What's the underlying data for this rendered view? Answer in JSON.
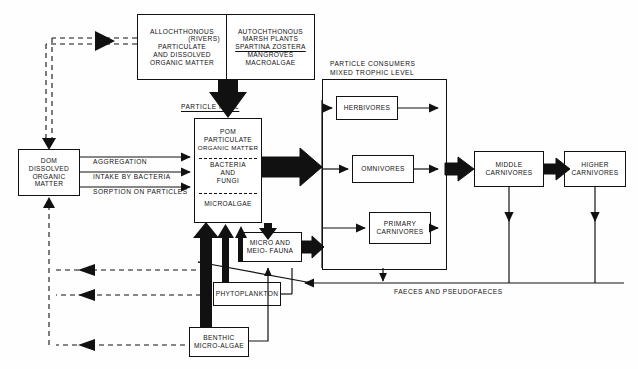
{
  "diagram": {
    "colors": {
      "ink": "#111111",
      "paper": "#ffffff"
    }
  },
  "sources": {
    "allochthonous": {
      "name": "allochthonous-organic-matter",
      "lines": [
        "ALLOCHTHONOUS",
        "(RIVERS)",
        "PARTICULATE",
        "AND DISSOLVED",
        "ORGANIC MATTER"
      ]
    },
    "autochthonous": {
      "name": "autochthonous-plants",
      "lines": [
        "AUTOCHTHONOUS",
        "MARSH PLANTS",
        "SPARTINA ZOSTERA",
        "MANGROVES",
        "MACROALGAE"
      ],
      "underlined_line_index": 2
    }
  },
  "particle_pool": {
    "heading": "PARTICLE  POOL",
    "sections": [
      {
        "name": "pom",
        "lines": [
          "POM",
          "PARTICULATE",
          "ORGANIC MATTER"
        ]
      },
      {
        "name": "bacteria-fungi",
        "lines": [
          "BACTERIA",
          "AND",
          "FUNGI"
        ]
      },
      {
        "name": "microalgae",
        "lines": [
          "MICROALGAE"
        ]
      }
    ]
  },
  "dom": {
    "name": "dissolved-organic-matter",
    "lines": [
      "DOM",
      "DISSOLVED",
      "ORGANIC",
      "MATTER"
    ],
    "pathways": [
      "AGGREGATION",
      "INTAKE BY BACTERIA",
      "SORPTION ON PARTICLES"
    ]
  },
  "consumers": {
    "heading_lines": [
      "PARTICLE CONSUMERS",
      "MIXED TROPHIC LEVEL"
    ],
    "boxes": [
      {
        "name": "herbivores",
        "lines": [
          "HERBIVORES"
        ]
      },
      {
        "name": "omnivores",
        "lines": [
          "OMNIVORES"
        ]
      },
      {
        "name": "primary-carnivores",
        "lines": [
          "PRIMARY",
          "CARNIVORES"
        ]
      }
    ]
  },
  "carnivores": [
    {
      "name": "middle-carnivores",
      "lines": [
        "MIDDLE",
        "CARNIVORES"
      ]
    },
    {
      "name": "higher-carnivores",
      "lines": [
        "HIGHER",
        "CARNIVORES"
      ]
    }
  ],
  "benthic": [
    {
      "name": "micro-meio-fauna",
      "lines": [
        "MICRO AND",
        "MEIO- FAUNA"
      ]
    },
    {
      "name": "phytoplankton",
      "lines": [
        "PHYTOPLANKTON"
      ]
    },
    {
      "name": "benthic-micro-algae",
      "lines": [
        "BENTHIC",
        "MICRO-ALGAE"
      ]
    }
  ],
  "annotations": {
    "faeces": "FAECES AND PSEUDOFAECES"
  }
}
